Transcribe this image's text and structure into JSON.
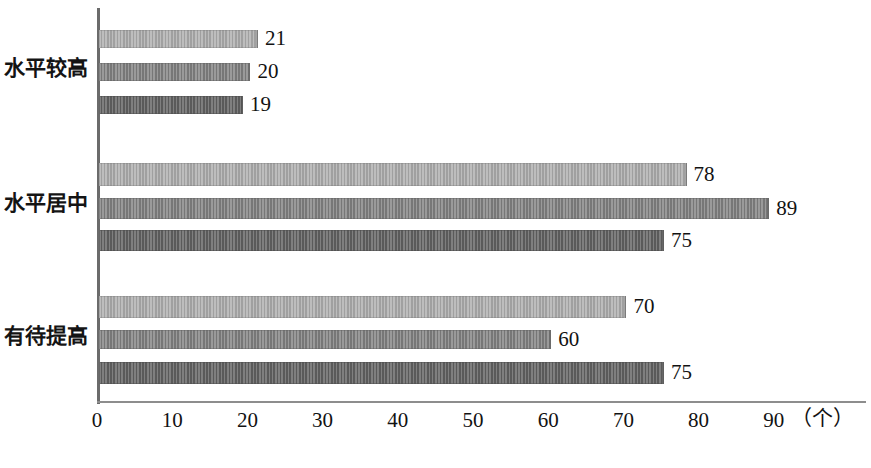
{
  "chart_data": {
    "type": "bar",
    "orientation": "horizontal",
    "title": "",
    "subtitle": "",
    "xlabel": "（个）",
    "ylabel": "",
    "xlim": [
      0,
      95
    ],
    "grid": false,
    "legend": null,
    "categories": [
      "水平较高",
      "水平居中",
      "有待提高"
    ],
    "series": [
      {
        "name": "series-1",
        "tone": "tone-light",
        "values": [
          21,
          78,
          70
        ]
      },
      {
        "name": "series-2",
        "tone": "tone-mid",
        "values": [
          20,
          89,
          60
        ]
      },
      {
        "name": "series-3",
        "tone": "tone-dark",
        "values": [
          19,
          75,
          75
        ]
      }
    ],
    "xticks": [
      0,
      10,
      20,
      30,
      40,
      50,
      60,
      70,
      80,
      90
    ],
    "xtick_labels": [
      "0",
      "10",
      "20",
      "30",
      "40",
      "50",
      "60",
      "70",
      "80",
      "90"
    ],
    "unit_label": "（个）",
    "colors": {
      "tone_light": "#b0b0b0",
      "tone_mid": "#898989",
      "tone_dark": "#6b6b6b",
      "axis": "#6b6b6b",
      "text": "#121212",
      "background": "#ffffff"
    }
  },
  "bars": [
    {
      "label": "21",
      "value": 21,
      "tone": "tone-light",
      "group": 0,
      "top": 30,
      "height": 18
    },
    {
      "label": "20",
      "value": 20,
      "tone": "tone-mid",
      "group": 0,
      "top": 63,
      "height": 18
    },
    {
      "label": "19",
      "value": 19,
      "tone": "tone-dark",
      "group": 0,
      "top": 96,
      "height": 18
    },
    {
      "label": "78",
      "value": 78,
      "tone": "tone-light",
      "group": 1,
      "top": 163,
      "height": 23
    },
    {
      "label": "89",
      "value": 89,
      "tone": "tone-mid",
      "group": 1,
      "top": 198,
      "height": 21
    },
    {
      "label": "75",
      "value": 75,
      "tone": "tone-dark",
      "group": 1,
      "top": 230,
      "height": 21
    },
    {
      "label": "70",
      "value": 70,
      "tone": "tone-light",
      "group": 2,
      "top": 296,
      "height": 22
    },
    {
      "label": "60",
      "value": 60,
      "tone": "tone-mid",
      "group": 2,
      "top": 330,
      "height": 19
    },
    {
      "label": "75",
      "value": 75,
      "tone": "tone-dark",
      "group": 2,
      "top": 362,
      "height": 22
    }
  ],
  "category_labels": [
    {
      "text": "水平较高",
      "top": 58
    },
    {
      "text": "水平居中",
      "top": 193
    },
    {
      "text": "有待提高",
      "top": 326
    }
  ],
  "axis": {
    "origin_x": 97,
    "px_per_unit": 7.52,
    "baseline_y": 401,
    "unit_x": 822
  }
}
